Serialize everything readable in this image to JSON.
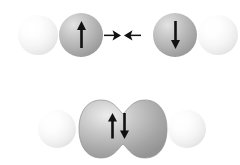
{
  "figure": {
    "title": "Covalent bond formation from two atoms with opposite electron spins",
    "width": 240,
    "height": 165,
    "background_color": "#ffffff"
  },
  "colors": {
    "sphere_light": "#f2f2f2",
    "sphere_light_highlight": "#ffffff",
    "sphere_light_edge": "#cfcfcf",
    "sphere_gray": "#b0b0b0",
    "sphere_gray_highlight": "#e3e3e3",
    "sphere_gray_edge": "#868686",
    "arrow_color": "#111111",
    "orbital_fill": "#b5b5b5",
    "orbital_highlight": "#e6e6e6",
    "orbital_edge": "#8a8a8a"
  },
  "panels": [
    {
      "id": "before-bonding",
      "label": "Two separate atoms approaching",
      "atoms": [
        {
          "id": "left-outer-atom",
          "label": "left outer atom",
          "shade": "light",
          "spin": null,
          "cx": 38,
          "cy": 35,
          "r": 20
        },
        {
          "id": "left-valence-atom",
          "label": "left atom with spin-up electron",
          "shade": "gray",
          "spin": "up",
          "spin_symbol": "↑",
          "cx": 81,
          "cy": 35,
          "r": 22
        },
        {
          "id": "right-valence-atom",
          "label": "right atom with spin-down electron",
          "shade": "gray",
          "spin": "down",
          "spin_symbol": "↓",
          "cx": 175,
          "cy": 35,
          "r": 22
        },
        {
          "id": "right-outer-atom",
          "label": "right outer atom",
          "shade": "light",
          "spin": null,
          "cx": 217,
          "cy": 35,
          "r": 20
        }
      ],
      "interaction_arrows": [
        {
          "id": "attraction-arrow-right",
          "direction": "right",
          "symbol": "→",
          "x": 107,
          "y": 30
        },
        {
          "id": "attraction-arrow-left",
          "direction": "left",
          "symbol": "←",
          "x": 126,
          "y": 30
        }
      ]
    },
    {
      "id": "after-bonding",
      "label": "Merged molecular orbital with paired electron spins",
      "atoms": [
        {
          "id": "bottom-left-outer-atom",
          "label": "bottom left outer atom",
          "shade": "light",
          "spin": null,
          "cx": 57,
          "cy": 129,
          "r": 19
        },
        {
          "id": "bottom-right-outer-atom",
          "label": "bottom right outer atom",
          "shade": "light",
          "spin": null,
          "cx": 187,
          "cy": 129,
          "r": 19
        }
      ],
      "orbital": {
        "id": "shared-molecular-orbital",
        "label": "shared bonding orbital",
        "x": 78,
        "y": 99,
        "width": 90,
        "height": 60,
        "paired_spin_symbol": "↑↓"
      }
    }
  ]
}
